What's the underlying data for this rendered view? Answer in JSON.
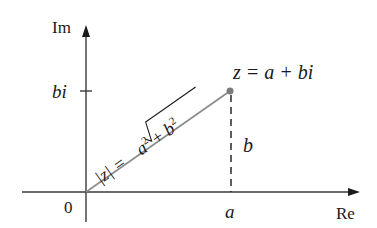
{
  "diagram": {
    "type": "complex-plane",
    "axes": {
      "vertical_label": "Im",
      "horizontal_label": "Re",
      "origin_label": "0"
    },
    "ticks": {
      "imaginary_tick": "bi",
      "real_tick": "a"
    },
    "point": {
      "label": "z = a + bi"
    },
    "vector_label": {
      "lhs": "|z| = ",
      "radicand_a": "a",
      "radicand_plus": " + ",
      "radicand_b": "b",
      "exp": "2"
    },
    "vertical_segment_label": "b",
    "colors": {
      "axis": "#3a3a3a",
      "vector": "#8a8a8a",
      "point": "#7a7a7a",
      "text": "#1a1a1a"
    }
  }
}
